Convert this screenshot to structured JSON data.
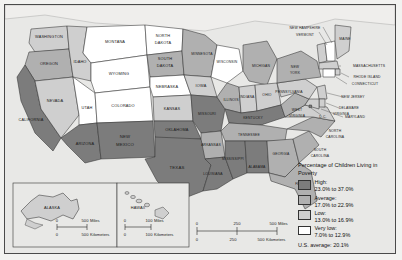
{
  "map": {
    "title": "Percentage of Children Living in Poverty",
    "us_average_text": "U.S. average: 20.1%",
    "colors": {
      "high": "#7c7c7c",
      "average": "#b0b0b0",
      "low": "#cfcfcf",
      "very_low": "#ffffff",
      "water": "#f0efec",
      "border": "#333333",
      "background": "#e8e8e6"
    },
    "legend": [
      {
        "key": "high",
        "label": "High:",
        "range": "23.0% to 37.0%",
        "color": "#7c7c7c"
      },
      {
        "key": "average",
        "label": "Average:",
        "range": "17.0% to 22.9%",
        "color": "#b0b0b0"
      },
      {
        "key": "low",
        "label": "Low:",
        "range": "13.0% to 16.9%",
        "color": "#cfcfcf"
      },
      {
        "key": "very_low",
        "label": "Very low:",
        "range": "7.0% to 12.9%",
        "color": "#ffffff"
      }
    ],
    "scale_main": {
      "miles": {
        "ticks": [
          "0",
          "250",
          "500"
        ],
        "unit": "Miles"
      },
      "kilometers": {
        "ticks": [
          "0",
          "250",
          "500"
        ],
        "unit": "Kilometers"
      }
    },
    "scale_alaska": {
      "miles": {
        "ticks": [
          "0",
          "500"
        ],
        "unit": "Miles"
      },
      "kilometers": {
        "ticks": [
          "0",
          "500"
        ],
        "unit": "Kilometers"
      }
    },
    "scale_hawaii": {
      "miles": {
        "ticks": [
          "0",
          "100"
        ],
        "unit": "Miles"
      },
      "kilometers": {
        "ticks": [
          "0",
          "100"
        ],
        "unit": "Kilometers"
      }
    },
    "insets": [
      {
        "name": "alaska",
        "label": "ALASKA"
      },
      {
        "name": "hawaii",
        "label": "HAWAII"
      }
    ],
    "states": [
      {
        "name": "WASHINGTON",
        "class": "low"
      },
      {
        "name": "OREGON",
        "class": "average"
      },
      {
        "name": "CALIFORNIA",
        "class": "high"
      },
      {
        "name": "IDAHO",
        "class": "low"
      },
      {
        "name": "NEVADA",
        "class": "low"
      },
      {
        "name": "MONTANA",
        "class": "very_low"
      },
      {
        "name": "WYOMING",
        "class": "very_low"
      },
      {
        "name": "UTAH",
        "class": "very_low"
      },
      {
        "name": "COLORADO",
        "class": "very_low"
      },
      {
        "name": "ARIZONA",
        "class": "high"
      },
      {
        "name": "NEW MEXICO",
        "class": "high"
      },
      {
        "name": "NORTH DAKOTA",
        "class": "very_low"
      },
      {
        "name": "SOUTH DAKOTA",
        "class": "average"
      },
      {
        "name": "NEBRASKA",
        "class": "very_low"
      },
      {
        "name": "KANSAS",
        "class": "low"
      },
      {
        "name": "OKLAHOMA",
        "class": "high"
      },
      {
        "name": "TEXAS",
        "class": "high"
      },
      {
        "name": "MINNESOTA",
        "class": "average"
      },
      {
        "name": "IOWA",
        "class": "low"
      },
      {
        "name": "MISSOURI",
        "class": "high"
      },
      {
        "name": "ARKANSAS",
        "class": "average"
      },
      {
        "name": "LOUISIANA",
        "class": "high"
      },
      {
        "name": "WISCONSIN",
        "class": "very_low"
      },
      {
        "name": "ILLINOIS",
        "class": "average"
      },
      {
        "name": "MICHIGAN",
        "class": "average"
      },
      {
        "name": "INDIANA",
        "class": "low"
      },
      {
        "name": "OHIO",
        "class": "low"
      },
      {
        "name": "KENTUCKY",
        "class": "high"
      },
      {
        "name": "TENNESSEE",
        "class": "average"
      },
      {
        "name": "MISSISSIPPI",
        "class": "high"
      },
      {
        "name": "ALABAMA",
        "class": "high"
      },
      {
        "name": "GEORGIA",
        "class": "average"
      },
      {
        "name": "FLORIDA",
        "class": "average"
      },
      {
        "name": "SOUTH CAROLINA",
        "class": "average"
      },
      {
        "name": "NORTH CAROLINA",
        "class": "average"
      },
      {
        "name": "VIRGINIA",
        "class": "low"
      },
      {
        "name": "WEST VIRGINIA",
        "class": "average"
      },
      {
        "name": "PENNSYLVANIA",
        "class": "low"
      },
      {
        "name": "NEW YORK",
        "class": "average"
      },
      {
        "name": "MAINE",
        "class": "low"
      },
      {
        "name": "NEW HAMPSHIRE",
        "class": "very_low"
      },
      {
        "name": "VERMONT",
        "class": "low"
      },
      {
        "name": "MASSACHUSETTS",
        "class": "low"
      },
      {
        "name": "RHODE ISLAND",
        "class": "low"
      },
      {
        "name": "CONNECTICUT",
        "class": "very_low"
      },
      {
        "name": "NEW JERSEY",
        "class": "low"
      },
      {
        "name": "DELAWARE",
        "class": "low"
      },
      {
        "name": "MARYLAND",
        "class": "low"
      },
      {
        "name": "D.C.",
        "class": "high"
      },
      {
        "name": "ALASKA",
        "class": "low"
      },
      {
        "name": "HAWAII",
        "class": "low"
      }
    ]
  }
}
